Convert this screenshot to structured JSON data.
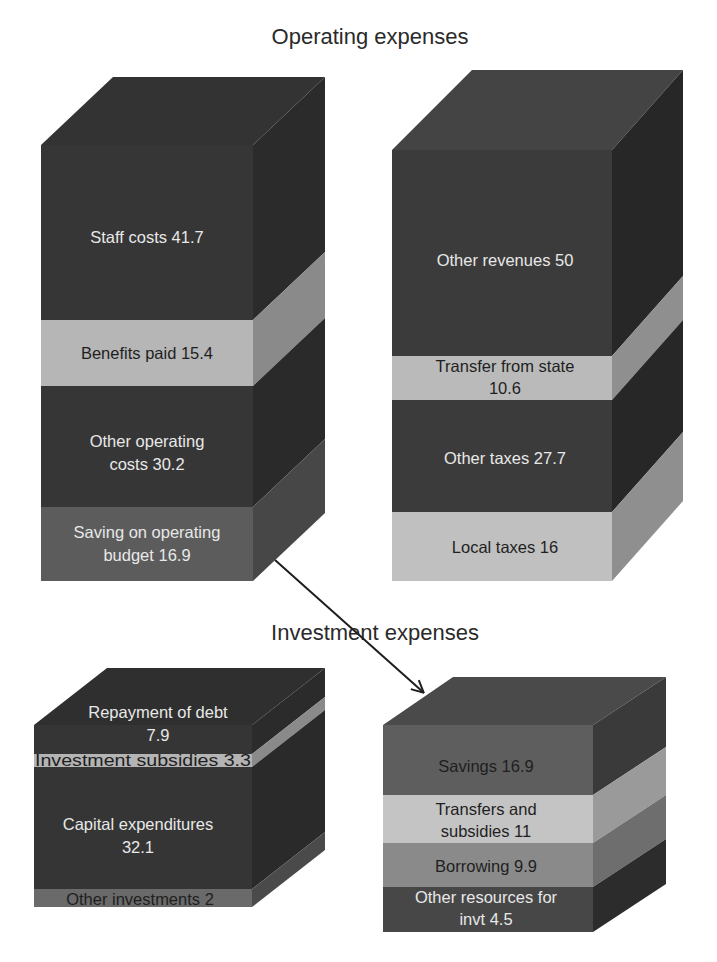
{
  "titles": {
    "operating": "Operating expenses",
    "investment": "Investment expenses"
  },
  "colors": {
    "background": "#ffffff",
    "very_dark": "#2e2e2e",
    "dark": "#3a3a3a",
    "medium_dark": "#555555",
    "medium": "#7a7a7a",
    "light": "#b4b4b4",
    "lighter": "#c4c4c4",
    "arrow": "#1e1e1e"
  },
  "blocks": {
    "operating_uses": {
      "segments": [
        {
          "label_line1": "Staff costs 41.7",
          "label_line2": "",
          "value": 41.7
        },
        {
          "label_line1": "Benefits paid 15.4",
          "label_line2": "",
          "value": 15.4
        },
        {
          "label_line1": "Other operating",
          "label_line2": "costs 30.2",
          "value": 30.2
        },
        {
          "label_line1": "Saving on operating",
          "label_line2": "budget 16.9",
          "value": 16.9
        }
      ]
    },
    "operating_resources": {
      "segments": [
        {
          "label_line1": "Other revenues 50",
          "label_line2": "",
          "value": 50
        },
        {
          "label_line1": "Transfer from state",
          "label_line2": "10.6",
          "value": 10.6
        },
        {
          "label_line1": "Other taxes 27.7",
          "label_line2": "",
          "value": 27.7
        },
        {
          "label_line1": "Local taxes 16",
          "label_line2": "",
          "value": 16
        }
      ]
    },
    "investment_uses": {
      "segments": [
        {
          "label_line1": "Repayment of debt",
          "label_line2": "7.9",
          "value": 7.9
        },
        {
          "label_line1": "Investment subsidies 3.3",
          "label_line2": "",
          "value": 3.3
        },
        {
          "label_line1": "Capital expenditures",
          "label_line2": "32.1",
          "value": 32.1
        },
        {
          "label_line1": "Other investments 2",
          "label_line2": "",
          "value": 2
        }
      ]
    },
    "investment_resources": {
      "segments": [
        {
          "label_line1": "Savings 16.9",
          "label_line2": "",
          "value": 16.9
        },
        {
          "label_line1": "Transfers and",
          "label_line2": "subsidies 11",
          "value": 11
        },
        {
          "label_line1": "Borrowing 9.9",
          "label_line2": "",
          "value": 9.9
        },
        {
          "label_line1": "Other resources for",
          "label_line2": "invt 4.5",
          "value": 4.5
        }
      ]
    }
  },
  "arrow": {
    "from": "Saving on operating budget 16.9",
    "to": "Savings 16.9"
  }
}
